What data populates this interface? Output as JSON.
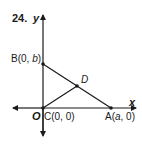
{
  "problem": {
    "number": "24."
  },
  "axes": {
    "x_label": "x",
    "y_label": "y",
    "origin_label": "O"
  },
  "points": {
    "B": {
      "name": "B",
      "coords": "(0, b)",
      "coord_var": "b"
    },
    "A": {
      "name": "A",
      "coords": "(a, 0)",
      "coord_var": "a"
    },
    "C": {
      "name": "C",
      "coords": "(0, 0)"
    },
    "D": {
      "name": "D"
    }
  },
  "labels": {
    "B_text": "B(0, ",
    "B_var": "b",
    "B_close": ")",
    "A_text": "A(",
    "A_var": "a",
    "A_close": ", 0)",
    "C_text": "C(0, 0)",
    "D_text": "D"
  },
  "segments": [
    {
      "from": "B",
      "to": "A"
    },
    {
      "from": "C",
      "to": "D"
    }
  ],
  "colors": {
    "ink": "#1a1a1a",
    "background": "#ffffff"
  }
}
